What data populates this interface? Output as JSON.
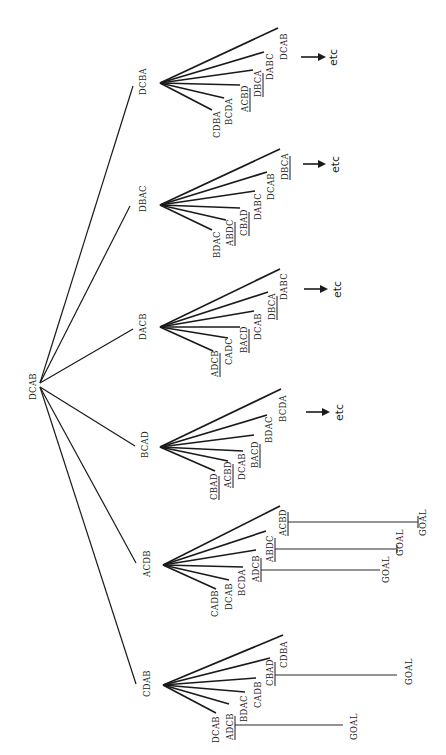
{
  "diagram": {
    "title": "",
    "root": {
      "label": "DCAB",
      "x": 40,
      "y": 385
    },
    "branches": [
      {
        "label": "DCBA",
        "y": 83,
        "children": [
          {
            "label": "CDBA",
            "underlined": false
          },
          {
            "label": "BCDA",
            "underlined": false
          },
          {
            "label": "ACBD",
            "underlined": true
          },
          {
            "label": "DBCA",
            "underlined": true
          },
          {
            "label": "DABC",
            "underlined": false
          },
          {
            "label": "DCAB",
            "underlined": false
          }
        ],
        "continuation": "etc"
      },
      {
        "label": "DBAC",
        "y": 205,
        "children": [
          {
            "label": "BDAC",
            "underlined": false
          },
          {
            "label": "ABDC",
            "underlined": true
          },
          {
            "label": "CBAD",
            "underlined": true
          },
          {
            "label": "DABC",
            "underlined": false
          },
          {
            "label": "DCAB",
            "underlined": false
          },
          {
            "label": "DBCA",
            "underlined": true
          }
        ],
        "continuation": "etc"
      },
      {
        "label": "DACB",
        "y": 327,
        "children": [
          {
            "label": "ADCB",
            "underlined": true
          },
          {
            "label": "CADC",
            "underlined": false
          },
          {
            "label": "BACD",
            "underlined": true
          },
          {
            "label": "DCAB",
            "underlined": false
          },
          {
            "label": "DBCA",
            "underlined": true
          },
          {
            "label": "DABC",
            "underlined": false
          }
        ],
        "continuation": "etc"
      },
      {
        "label": "BCAD",
        "y": 447,
        "children": [
          {
            "label": "CBAD",
            "underlined": true
          },
          {
            "label": "ACBD",
            "underlined": true
          },
          {
            "label": "DCAB",
            "underlined": false
          },
          {
            "label": "BACD",
            "underlined": true
          },
          {
            "label": "BDAC",
            "underlined": false
          },
          {
            "label": "BCDA",
            "underlined": false
          }
        ],
        "continuation": "etc"
      },
      {
        "label": "ACDB",
        "y": 565,
        "children": [
          {
            "label": "CADB",
            "underlined": false
          },
          {
            "label": "DCAB",
            "underlined": false
          },
          {
            "label": "BCDA",
            "underlined": false
          },
          {
            "label": "ADCB",
            "underlined": true,
            "goal": "GOAL"
          },
          {
            "label": "ABDC",
            "underlined": true,
            "goal": "GOAL"
          },
          {
            "label": "ACBD",
            "underlined": true,
            "goal": "GOAL"
          }
        ],
        "continuation": ""
      },
      {
        "label": "CDAB",
        "y": 685,
        "children": [
          {
            "label": "DCAB",
            "underlined": false
          },
          {
            "label": "ADCB",
            "underlined": true,
            "goal": "GOAL"
          },
          {
            "label": "BDAC",
            "underlined": false
          },
          {
            "label": "CADB",
            "underlined": false
          },
          {
            "label": "CBAD",
            "underlined": true,
            "goal": "GOAL"
          },
          {
            "label": "CDBA",
            "underlined": false
          }
        ],
        "continuation": ""
      }
    ]
  },
  "labels": {
    "root": "DCAB",
    "n1": "DCBA",
    "n2": "DBAC",
    "n3": "DACB",
    "n4": "BCAD",
    "n5": "ACDB",
    "n6": "CDAB",
    "n1c": [
      "CDBA",
      "BCDA",
      "ACBD",
      "DBCA",
      "DABC",
      "DCAB"
    ],
    "n2c": [
      "BDAC",
      "ABDC",
      "CBAD",
      "DABC",
      "DCAB",
      "DBCA"
    ],
    "n3c": [
      "ADCB",
      "CADC",
      "BACD",
      "DCAB",
      "DBCA",
      "DABC"
    ],
    "n4c": [
      "CBAD",
      "ACBD",
      "DCAB",
      "BACD",
      "BDAC",
      "BCDA"
    ],
    "n5c": [
      "CADB",
      "DCAB",
      "BCDA",
      "ADCB",
      "ABDC",
      "ACBD"
    ],
    "n6c": [
      "DCAB",
      "ADCB",
      "BDAC",
      "CADB",
      "CBAD",
      "CDBA"
    ],
    "etc": "etc",
    "goal": "GOAL"
  }
}
